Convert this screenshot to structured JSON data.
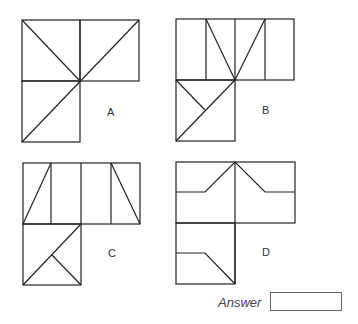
{
  "figures": [
    {
      "label": "A"
    },
    {
      "label": "B"
    },
    {
      "label": "C"
    },
    {
      "label": "D"
    }
  ],
  "answer": {
    "label": "Answer",
    "value": ""
  }
}
